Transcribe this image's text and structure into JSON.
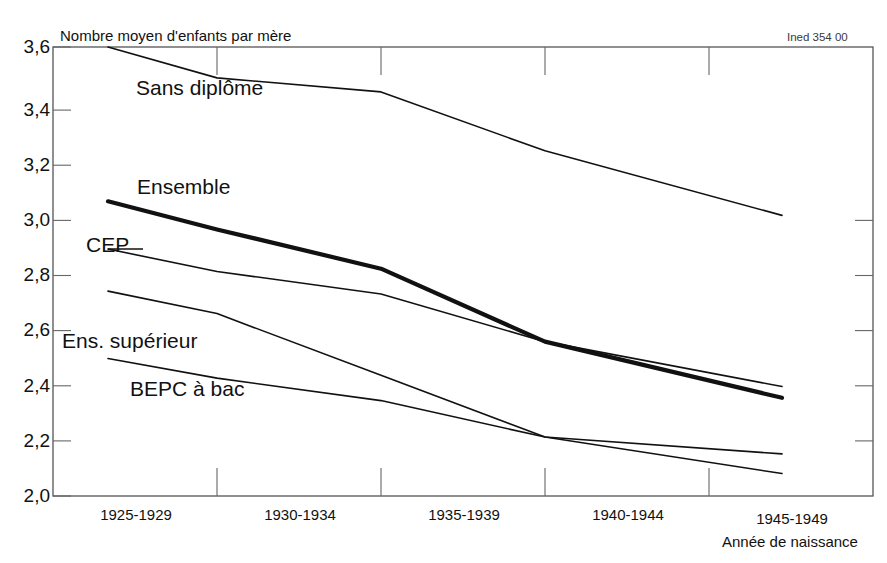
{
  "figure": {
    "credit": "Ined 354 00",
    "y_axis_title": "Nombre moyen d'enfants par mère",
    "x_axis_title": "Année de naissance"
  },
  "series_labels": {
    "sans_diplome": "Sans diplôme",
    "ensemble": "Ensemble",
    "cep": "CEP",
    "ens_superieur": "Ens. supérieur",
    "bepc_a_bac": "BEPC à bac"
  },
  "y_ticks": [
    "2,0",
    "2,2",
    "2,4",
    "2,6",
    "2,8",
    "3,0",
    "3,2",
    "3,4",
    "3,6"
  ],
  "x_ticks": [
    "1925-1929",
    "1930-1934",
    "1935-1939",
    "1940-1944",
    "1945-1949"
  ],
  "colors": {
    "line": "#111111",
    "axis": "#444444",
    "background": "#ffffff"
  },
  "chart_data": {
    "type": "line",
    "title": "",
    "subtitle": "",
    "xlabel": "Année de naissance",
    "ylabel": "Nombre moyen d'enfants par mère",
    "categories": [
      "1925-1929",
      "1930-1934",
      "1935-1939",
      "1940-1944",
      "1945-1949"
    ],
    "ylim": [
      2.0,
      3.6
    ],
    "ytick_values": [
      2.0,
      2.2,
      2.4,
      2.6,
      2.8,
      3.0,
      3.2,
      3.4,
      3.6
    ],
    "ytick_labels": [
      "2,0",
      "2,2",
      "2,4",
      "2,6",
      "2,8",
      "3,0",
      "3,2",
      "3,4",
      "3,6"
    ],
    "grid": false,
    "legend": "inline-labels",
    "annotations": [
      "Ined 354 00"
    ],
    "series": [
      {
        "name": "Sans diplôme",
        "values": [
          3.6,
          3.49,
          3.44,
          3.23,
          3.0
        ],
        "emphasis": false,
        "linewidth": 1.6
      },
      {
        "name": "Ensemble",
        "values": [
          3.05,
          2.95,
          2.81,
          2.55,
          2.35
        ],
        "emphasis": true,
        "linewidth": 4.2
      },
      {
        "name": "CEP",
        "values": [
          2.88,
          2.8,
          2.72,
          2.55,
          2.39
        ],
        "emphasis": false,
        "linewidth": 1.6
      },
      {
        "name": "Ens. supérieur",
        "values": [
          2.73,
          2.65,
          2.43,
          2.21,
          2.15
        ],
        "emphasis": false,
        "linewidth": 1.6
      },
      {
        "name": "BEPC à bac",
        "values": [
          2.49,
          2.42,
          2.34,
          2.21,
          2.08
        ],
        "emphasis": false,
        "linewidth": 1.6
      }
    ]
  }
}
